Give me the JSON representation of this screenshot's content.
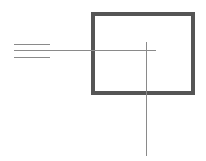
{
  "diagram": {
    "background": "#ffffff",
    "rectangle": {
      "x": 91,
      "y": 12,
      "width": 104,
      "height": 83,
      "border_width": 4,
      "color": "#555555"
    },
    "lines": [
      {
        "id": "short-top",
        "orientation": "horizontal",
        "x1": 14,
        "x2": 50,
        "y": 44,
        "color": "#8a8a8a"
      },
      {
        "id": "long-middle",
        "orientation": "horizontal",
        "x1": 14,
        "x2": 156,
        "y": 50,
        "color": "#8a8a8a"
      },
      {
        "id": "short-bottom",
        "orientation": "horizontal",
        "x1": 14,
        "x2": 50,
        "y": 57,
        "color": "#8a8a8a"
      },
      {
        "id": "vertical",
        "orientation": "vertical",
        "x": 146,
        "y1": 42,
        "y2": 156,
        "color": "#8a8a8a"
      }
    ]
  }
}
